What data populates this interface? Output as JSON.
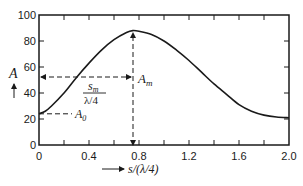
{
  "chart_data": {
    "type": "line",
    "title": "",
    "xlabel": "s/(λ/4)",
    "ylabel": "A",
    "xlim": [
      0,
      2.0
    ],
    "ylim": [
      0,
      100
    ],
    "grid": false,
    "legend": null,
    "x_ticks": [
      0,
      0.4,
      0.8,
      1.2,
      1.6,
      2.0
    ],
    "x_tick_labels": [
      "0",
      "0.4",
      "0.8",
      "1.2",
      "1.6",
      "2.0"
    ],
    "x_minor_ticks": [
      0.2,
      0.6,
      1.0,
      1.4,
      1.8
    ],
    "y_ticks": [
      0,
      20,
      40,
      60,
      80,
      100
    ],
    "y_tick_labels": [
      "0",
      "20",
      "40",
      "60",
      "80",
      "100"
    ],
    "series": [
      {
        "name": "A",
        "x": [
          0,
          0.05,
          0.1,
          0.2,
          0.3,
          0.4,
          0.5,
          0.6,
          0.7,
          0.75,
          0.8,
          0.9,
          1.0,
          1.1,
          1.2,
          1.3,
          1.4,
          1.5,
          1.6,
          1.7,
          1.8,
          1.9,
          2.0
        ],
        "values": [
          24,
          26,
          30,
          40,
          52,
          63,
          73,
          81,
          86.5,
          88,
          87.5,
          85,
          80,
          73,
          65,
          56,
          47,
          39,
          31,
          26,
          23,
          21.5,
          21
        ]
      }
    ],
    "annotations": [
      {
        "label": "A_m",
        "text_main": "A",
        "text_sub": "m",
        "x": 0.75,
        "y": 88,
        "note": "peak amplitude; vertical dashed arrow from baseline to peak"
      },
      {
        "label": "A_0",
        "text_main": "A",
        "text_sub": "0",
        "x": 0,
        "y": 24,
        "note": "value at s=0; horizontal dashed line"
      },
      {
        "label": "s_m/(λ/4)",
        "numerator": "s",
        "numerator_sub": "m",
        "denominator": "λ/4",
        "note": "double-headed dashed arrow from x=0 to x=0.75 at A≈52"
      }
    ]
  },
  "labels": {
    "y_axis_letter": "A",
    "x_axis_label": "s/(λ/4)",
    "am_main": "A",
    "am_sub": "m",
    "a0_main": "A",
    "a0_sub": "0",
    "sm_num_main": "s",
    "sm_num_sub": "m",
    "sm_den": "λ/4"
  },
  "colors": {
    "line": "#1a1a1a",
    "background": "#ffffff"
  }
}
